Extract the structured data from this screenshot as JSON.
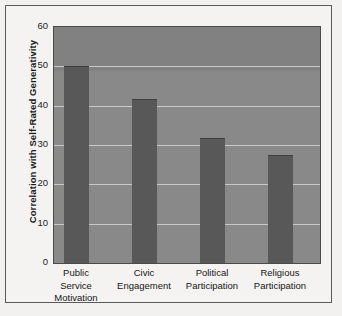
{
  "chart_data": {
    "type": "bar",
    "title": "",
    "subtitle": "",
    "xlabel": "",
    "ylabel": "Correlation with Self-Rated Generativity",
    "categories": [
      "Public Service Motivation",
      "Civic Engagement",
      "Political Participation",
      "Religious Participation"
    ],
    "category_lines": [
      [
        "Public",
        "Service",
        "Motivation"
      ],
      [
        "Civic",
        "Engagement"
      ],
      [
        "Political",
        "Participation"
      ],
      [
        "Religious",
        "Participation"
      ]
    ],
    "values": [
      50,
      41.8,
      31.8,
      27.5
    ],
    "ylim": [
      0,
      60
    ],
    "yticks": [
      0,
      10,
      20,
      30,
      40,
      50,
      60
    ],
    "ytick_labels": [
      "0",
      "10",
      "20",
      "30",
      "40",
      "50",
      "60"
    ],
    "grid": true,
    "grid_axis": "y",
    "legend": false,
    "legend_position": "none",
    "colors": {
      "bar": "#585858",
      "plot_background": "#898989",
      "gridline": "#c9c9c9",
      "axis": "#4a4a4a",
      "text": "#161616",
      "figure_background": "#f4f3f1",
      "frame_border": "#5a5a58"
    }
  }
}
